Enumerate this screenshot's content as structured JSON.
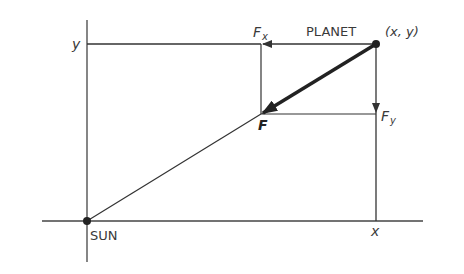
{
  "diagram": {
    "labels": {
      "sun": "SUN",
      "planet": "PLANET",
      "planet_coords": "(x, y)",
      "axis_y_tick": "y",
      "axis_x_tick": "x",
      "force": "F",
      "force_x": "F",
      "force_x_sub": "x",
      "force_y": "F",
      "force_y_sub": "y"
    },
    "colors": {
      "line": "#333333",
      "background": "#ffffff"
    },
    "points": {
      "sun": [
        87,
        221
      ],
      "planet": [
        376,
        44
      ],
      "force_tip": [
        261,
        114
      ]
    }
  }
}
